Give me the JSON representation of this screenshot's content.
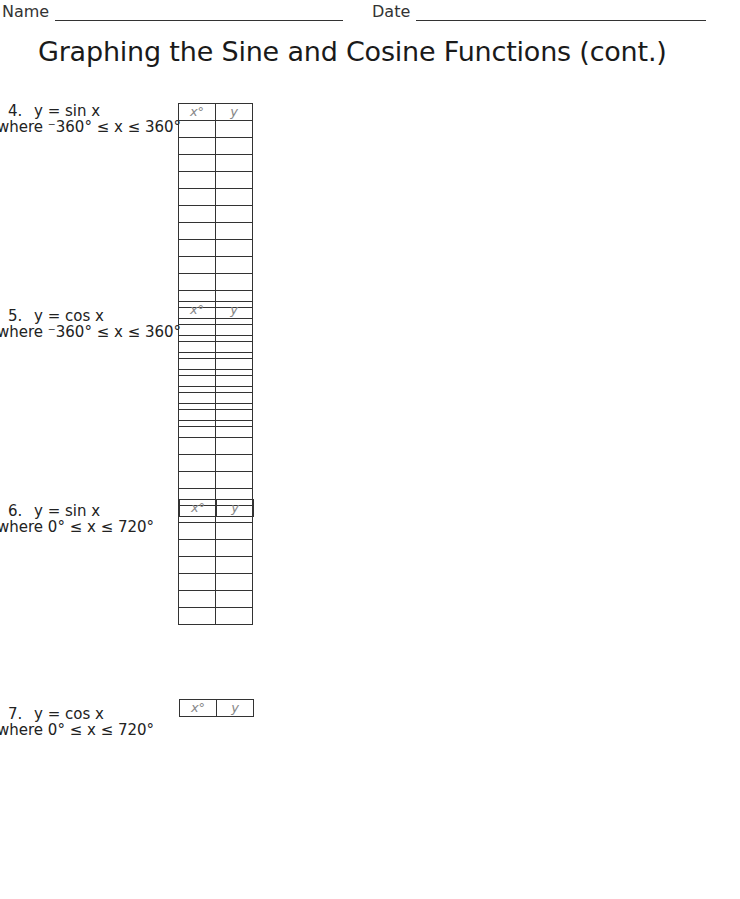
{
  "header": {
    "name_label": "Name",
    "date_label": "Date"
  },
  "title": "Graphing the Sine and Cosine Functions (cont.)",
  "table_headers": {
    "x": "x°",
    "y": "y"
  },
  "axis_labels": {
    "x": "x°",
    "y": "y"
  },
  "problems": [
    {
      "number": "4.",
      "equation": "y = sin x",
      "func": "sin",
      "domain_text": "where ⁻360° ≤ x ≤ 360°",
      "range_min": "⁻360°",
      "range_max": "360°",
      "rows": 9,
      "x_ticks_left": 6,
      "x_ticks_right": 12,
      "y_ticks_each": 6
    },
    {
      "number": "5.",
      "equation": "y = cos x",
      "func": "cos",
      "domain_text": "where ⁻360° ≤ x ≤ 360°",
      "range_min": "⁻360°",
      "range_max": "360°",
      "rows": 9,
      "x_ticks_left": 6,
      "x_ticks_right": 12,
      "y_ticks_each": 6
    },
    {
      "number": "6.",
      "equation": "y = sin x",
      "func": "sin",
      "domain_text": "where 0° ≤ x ≤ 720°",
      "range_min": "0°",
      "range_max": "720°",
      "rows": 9,
      "x_ticks_left": 0,
      "x_ticks_right": 17,
      "y_ticks_each": 6
    },
    {
      "number": "7.",
      "equation": "y = cos x",
      "func": "cos",
      "domain_text": "where 0° ≤ x ≤ 720°",
      "range_min": "0°",
      "range_max": "720°",
      "rows": 9,
      "x_ticks_left": 0,
      "x_ticks_right": 17,
      "y_ticks_each": 6
    }
  ]
}
